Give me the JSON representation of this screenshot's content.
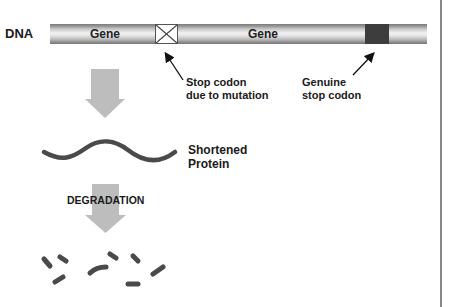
{
  "diagram": {
    "dna_label": "DNA",
    "gene_labels": [
      "Gene",
      "Gene"
    ],
    "mutation_stop_label_line1": "Stop codon",
    "mutation_stop_label_line2": "due to mutation",
    "genuine_stop_label_line1": "Genuine",
    "genuine_stop_label_line2": "stop codon",
    "protein_label_line1": "Shortened",
    "protein_label_line2": "Protein",
    "degradation_label": "DEGRADATION",
    "colors": {
      "dna_bar": "#c8c8c8",
      "genuine_stop_codon": "#3d3d3d",
      "flow_arrow": "#bdbdbd",
      "protein": "#4a4a4a",
      "text": "#1a1a1a"
    },
    "fragments_count": 8
  }
}
